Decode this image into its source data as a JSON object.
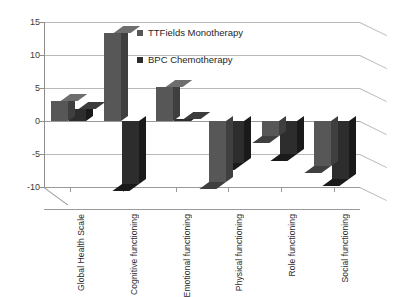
{
  "chart_data": {
    "type": "bar",
    "title": "",
    "xlabel": "",
    "ylabel": "",
    "ylim": [
      -10,
      15
    ],
    "yticks": [
      15,
      10,
      5,
      0,
      -5,
      -10
    ],
    "grid": true,
    "legend_position": "inside-top-left",
    "categories": [
      "Global Health Scale",
      "Cognitive functioning",
      "Emotional functioning",
      "Physical functioning",
      "Role functioning",
      "Social functioning"
    ],
    "series": [
      {
        "name": "TTFields Monotherapy",
        "color": "#575757",
        "values": [
          3.1,
          13.3,
          5.2,
          -9.3,
          -2.2,
          -6.8
        ]
      },
      {
        "name": "BPC Chemotherapy",
        "color": "#2d2d2d",
        "values": [
          1.8,
          -9.5,
          0.3,
          -6.3,
          -5.0,
          -8.8
        ]
      }
    ]
  },
  "legend": {
    "items": [
      {
        "label": "TTFields Monotherapy",
        "swatch": "#575757"
      },
      {
        "label": "BPC Chemotherapy",
        "swatch": "#2d2d2d"
      }
    ]
  },
  "axis": {
    "y_tick_labels": [
      "15",
      "10",
      "5",
      "0",
      "-5",
      "-10"
    ]
  },
  "colors": {
    "series_light": "#575757",
    "series_light_side": "#3f3f3f",
    "series_light_top": "#6e6e6e",
    "series_dark": "#2d2d2d",
    "series_dark_side": "#1a1a1a",
    "series_dark_top": "#3c3c3c",
    "gridline": "#b9b9b9",
    "axis": "#8d8d8d",
    "background": "#ffffff",
    "text": "#2b2b2b"
  }
}
